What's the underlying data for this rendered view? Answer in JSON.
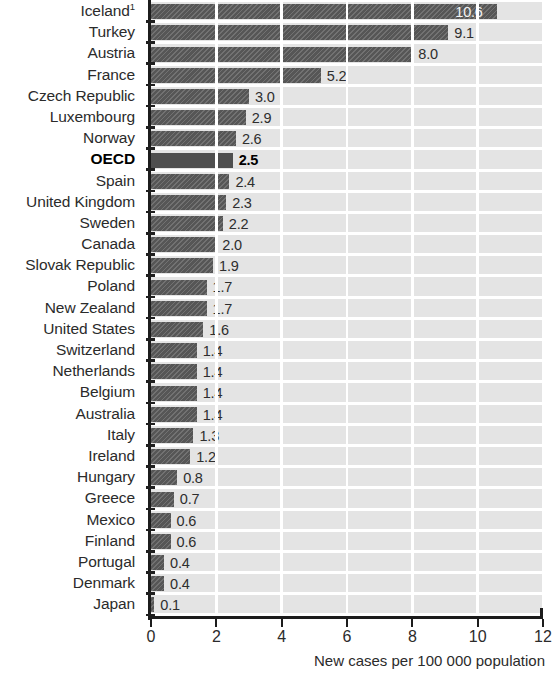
{
  "chart_data": {
    "type": "bar",
    "orientation": "horizontal",
    "title": "",
    "xlabel": "New cases per 100 000 population",
    "ylabel": "",
    "xlim": [
      0,
      12
    ],
    "xticks": [
      0,
      2,
      4,
      6,
      8,
      10,
      12
    ],
    "xtick_labels": [
      "0",
      "2",
      "4",
      "6",
      "8",
      "10",
      "12"
    ],
    "grid": "vertical white gridlines on light grey panel",
    "legend": "none",
    "highlight_category": "OECD",
    "categories": [
      "Iceland¹",
      "Turkey",
      "Austria",
      "France",
      "Czech Republic",
      "Luxembourg",
      "Norway",
      "OECD",
      "Spain",
      "United Kingdom",
      "Sweden",
      "Canada",
      "Slovak Republic",
      "Poland",
      "New Zealand",
      "United States",
      "Switzerland",
      "Netherlands",
      "Belgium",
      "Australia",
      "Italy",
      "Ireland",
      "Hungary",
      "Greece",
      "Mexico",
      "Finland",
      "Portugal",
      "Denmark",
      "Japan"
    ],
    "values": [
      10.6,
      9.1,
      8.0,
      5.2,
      3.0,
      2.9,
      2.6,
      2.5,
      2.4,
      2.3,
      2.2,
      2.0,
      1.9,
      1.7,
      1.7,
      1.6,
      1.4,
      1.4,
      1.4,
      1.4,
      1.3,
      1.2,
      0.8,
      0.7,
      0.6,
      0.6,
      0.4,
      0.4,
      0.1
    ],
    "value_labels": [
      "10.6",
      "9.1",
      "8.0",
      "5.2",
      "3.0",
      "2.9",
      "2.6",
      "2.5",
      "2.4",
      "2.3",
      "2.2",
      "2.0",
      "1.9",
      "1.7",
      "1.7",
      "1.6",
      "1.4",
      "1.4",
      "1.4",
      "1.4",
      "1.3",
      "1.2",
      "0.8",
      "0.7",
      "0.6",
      "0.6",
      "0.4",
      "0.4",
      "0.1"
    ],
    "footnote_marker": "1",
    "colors": {
      "bar": "#565656",
      "bar_highlight": "#4f4f4f",
      "panel_background": "#e4e4e4",
      "gridline": "#ffffff",
      "axis": "#1c1c1c",
      "text": "#2b2b2b",
      "value_label_on_bar": "#f2f2f2"
    }
  }
}
